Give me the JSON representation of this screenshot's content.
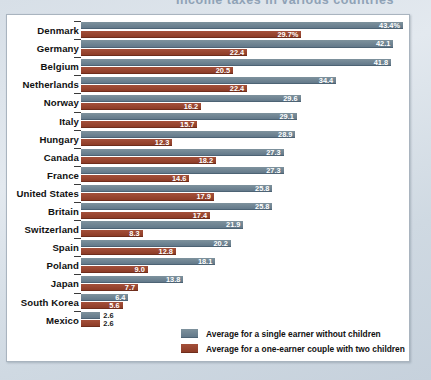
{
  "chart_data": {
    "type": "bar",
    "title": "Income taxes in various countries",
    "orientation": "horizontal",
    "grid": false,
    "legend_position": "bottom-right",
    "xlabel": "",
    "ylabel": "",
    "xlim": [
      0,
      43.4
    ],
    "categories": [
      "Denmark",
      "Germany",
      "Belgium",
      "Netherlands",
      "Norway",
      "Italy",
      "Hungary",
      "Canada",
      "France",
      "United States",
      "Britain",
      "Switzerland",
      "Spain",
      "Poland",
      "Japan",
      "South Korea",
      "Mexico"
    ],
    "series": [
      {
        "name": "Average for a single earner without children",
        "color": "#6d8593",
        "values": [
          43.4,
          42.1,
          41.8,
          34.4,
          29.6,
          29.1,
          28.9,
          27.3,
          27.3,
          25.8,
          25.8,
          21.9,
          20.2,
          18.1,
          13.8,
          6.4,
          2.6
        ],
        "labels": [
          "43.4%",
          "42.1",
          "41.8",
          "34.4",
          "29.6",
          "29.1",
          "28.9",
          "27.3",
          "27.3",
          "25.8",
          "25.8",
          "21.9",
          "20.2",
          "18.1",
          "13.8",
          "6.4",
          "2.6"
        ]
      },
      {
        "name": "Average for a one-earner couple with two children",
        "color": "#9e4430",
        "values": [
          29.7,
          22.4,
          20.5,
          22.4,
          16.2,
          15.7,
          12.3,
          18.2,
          14.6,
          17.9,
          17.4,
          8.3,
          12.8,
          9.0,
          7.7,
          5.6,
          2.6
        ],
        "labels": [
          "29.7%",
          "22.4",
          "20.5",
          "22.4",
          "16.2",
          "15.7",
          "12.3",
          "18.2",
          "14.6",
          "17.9",
          "17.4",
          "8.3",
          "12.8",
          "9.0",
          "7.7",
          "5.6",
          "2.6"
        ]
      }
    ]
  }
}
